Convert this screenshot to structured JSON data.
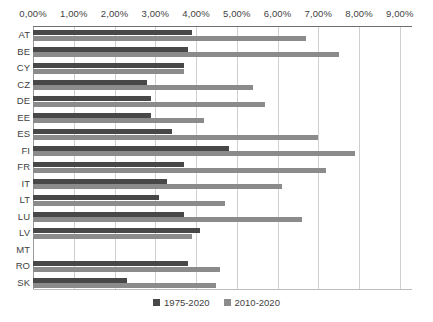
{
  "chart_data": {
    "type": "bar",
    "orientation": "horizontal",
    "title": "",
    "xlabel": "",
    "ylabel": "",
    "xlim": [
      0,
      9.3
    ],
    "grid": true,
    "legend_position": "bottom-center",
    "tick_labels": [
      "0,00%",
      "1,00%",
      "2,00%",
      "3,00%",
      "4,00%",
      "5,00%",
      "6,00%",
      "7,00%",
      "8,00%",
      "9,00%"
    ],
    "tick_values": [
      0,
      1,
      2,
      3,
      4,
      5,
      6,
      7,
      8,
      9
    ],
    "categories": [
      "AT",
      "BE",
      "CY",
      "CZ",
      "DE",
      "EE",
      "ES",
      "FI",
      "FR",
      "IT",
      "LT",
      "LU",
      "LV",
      "MT",
      "RO",
      "SK"
    ],
    "series": [
      {
        "name": "1975-2020",
        "color": "#484848",
        "values": [
          3.9,
          3.8,
          3.7,
          2.8,
          2.9,
          2.9,
          3.4,
          4.8,
          3.7,
          3.3,
          3.1,
          3.7,
          4.1,
          0.0,
          3.8,
          2.3
        ]
      },
      {
        "name": "2010-2020",
        "color": "#8b8b8b",
        "values": [
          6.7,
          7.5,
          3.7,
          5.4,
          5.7,
          4.2,
          7.0,
          7.9,
          7.2,
          6.1,
          4.7,
          6.6,
          3.9,
          0.0,
          4.6,
          4.5
        ]
      }
    ]
  },
  "legend": {
    "items": [
      {
        "label": "1975-2020",
        "color": "#484848"
      },
      {
        "label": "2010-2020",
        "color": "#8b8b8b"
      }
    ]
  },
  "colors": {
    "series_a": "#484848",
    "series_b": "#8b8b8b",
    "gridline": "#cfcfcf",
    "text": "#3f3f3f",
    "background": "#ffffff"
  }
}
